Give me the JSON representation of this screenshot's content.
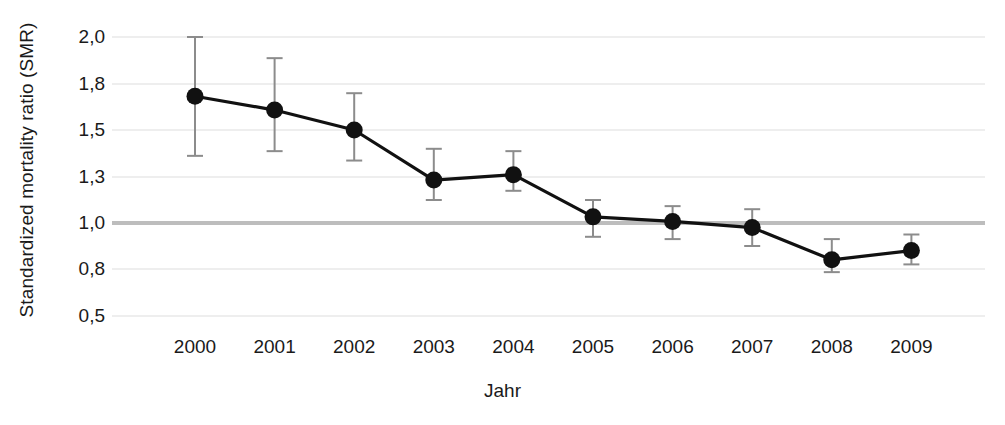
{
  "chart_data": {
    "type": "line",
    "title": "",
    "xlabel": "Jahr",
    "ylabel": "Standardized mortality ratio (SMR)",
    "x": [
      "2000",
      "2001",
      "2002",
      "2003",
      "2004",
      "2005",
      "2006",
      "2007",
      "2008",
      "2009"
    ],
    "categories": [
      "2000",
      "2001",
      "2002",
      "2003",
      "2004",
      "2005",
      "2006",
      "2007",
      "2008",
      "2009"
    ],
    "values": [
      1.72,
      1.63,
      1.5,
      1.28,
      1.31,
      1.04,
      1.01,
      0.98,
      0.84,
      0.88
    ],
    "error_low": [
      1.39,
      1.41,
      1.37,
      1.15,
      1.21,
      0.94,
      0.93,
      0.9,
      0.78,
      0.82
    ],
    "error_high": [
      2.0,
      1.91,
      1.74,
      1.42,
      1.41,
      1.15,
      1.11,
      1.09,
      0.93,
      0.95
    ],
    "series": [
      {
        "name": "SMR",
        "values": [
          1.72,
          1.63,
          1.5,
          1.28,
          1.31,
          1.04,
          1.01,
          0.98,
          0.84,
          0.88
        ],
        "error_low": [
          1.39,
          1.41,
          1.37,
          1.15,
          1.21,
          0.94,
          0.93,
          0.9,
          0.78,
          0.82
        ],
        "error_high": [
          2.0,
          1.91,
          1.74,
          1.42,
          1.41,
          1.15,
          1.11,
          1.09,
          0.93,
          0.95
        ]
      }
    ],
    "ytick_labels": [
      "2,0",
      "1,8",
      "1,5",
      "1,3",
      "1,0",
      "0,8",
      "0,5"
    ],
    "ytick_values": [
      2.0,
      1.8,
      1.5,
      1.3,
      1.0,
      0.8,
      0.5
    ],
    "reference_line": 1.0,
    "grid": true,
    "legend": "none",
    "colors": {
      "marker": "#111111",
      "line": "#111111",
      "errorbar": "#8c8c8c",
      "grid": "#e8e8e8",
      "reference": "#bdbdbd"
    }
  },
  "axis": {
    "ylabel": "Standardized mortality ratio (SMR)",
    "xlabel": "Jahr"
  }
}
